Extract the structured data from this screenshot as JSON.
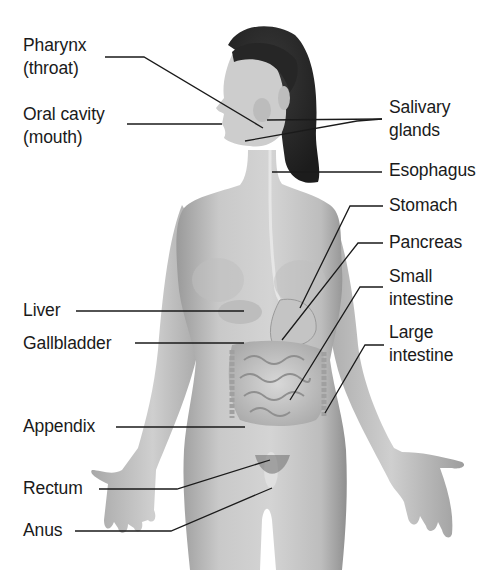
{
  "figure": {
    "colors": {
      "background": "#ffffff",
      "leader_line": "#1a1a1a",
      "label_text": "#1a1a1a",
      "skin": "#c8c8c8",
      "hair": "#2a2a2a"
    }
  },
  "labels": {
    "left": [
      {
        "id": "pharynx",
        "lines": [
          "Pharynx",
          "(throat)"
        ]
      },
      {
        "id": "oral-cavity",
        "lines": [
          "Oral cavity",
          "(mouth)"
        ]
      },
      {
        "id": "liver",
        "lines": [
          "Liver"
        ]
      },
      {
        "id": "gallbladder",
        "lines": [
          "Gallbladder"
        ]
      },
      {
        "id": "appendix",
        "lines": [
          "Appendix"
        ]
      },
      {
        "id": "rectum",
        "lines": [
          "Rectum"
        ]
      },
      {
        "id": "anus",
        "lines": [
          "Anus"
        ]
      }
    ],
    "right": [
      {
        "id": "salivary-glands",
        "lines": [
          "Salivary",
          "glands"
        ]
      },
      {
        "id": "esophagus",
        "lines": [
          "Esophagus"
        ]
      },
      {
        "id": "stomach",
        "lines": [
          "Stomach"
        ]
      },
      {
        "id": "pancreas",
        "lines": [
          "Pancreas"
        ]
      },
      {
        "id": "small-intestine",
        "lines": [
          "Small",
          "intestine"
        ]
      },
      {
        "id": "large-intestine",
        "lines": [
          "Large",
          "intestine"
        ]
      }
    ]
  }
}
